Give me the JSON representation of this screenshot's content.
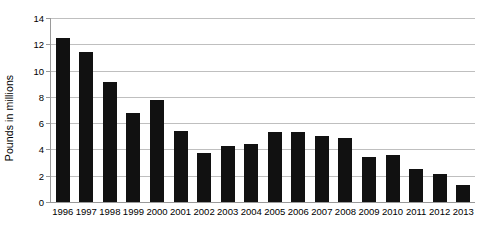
{
  "chart_data": {
    "type": "bar",
    "title": "",
    "subtitle": "",
    "xlabel": "",
    "ylabel": "Pounds in millions",
    "ylim": [
      0,
      14
    ],
    "ytick_step": 2,
    "yticks": [
      "14",
      "12",
      "10",
      "8",
      "6",
      "4",
      "2",
      "0"
    ],
    "grid": true,
    "legend": false,
    "legend_position": "none",
    "bar_color": "#111111",
    "gridline_color": "#bfbfbf",
    "axis_color": "#9a9a9a",
    "categories": [
      "1996",
      "1997",
      "1998",
      "1999",
      "2000",
      "2001",
      "2002",
      "2003",
      "2004",
      "2005",
      "2006",
      "2007",
      "2008",
      "2009",
      "2010",
      "2011",
      "2012",
      "2013"
    ],
    "values": [
      12.5,
      11.4,
      9.1,
      6.8,
      7.8,
      5.4,
      3.75,
      4.25,
      4.4,
      5.3,
      5.35,
      5.0,
      4.85,
      3.4,
      3.6,
      2.5,
      2.1,
      1.3
    ]
  }
}
